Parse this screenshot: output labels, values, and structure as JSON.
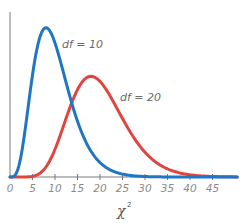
{
  "chart_data": {
    "type": "line",
    "title": "",
    "xlabel": "χ²",
    "xlabel_base": "χ",
    "xlabel_sup": "2",
    "ylabel": "",
    "xlim": [
      0,
      50
    ],
    "ylim": [
      0,
      0.105
    ],
    "grid": false,
    "x_ticks": [
      0,
      5,
      10,
      15,
      20,
      25,
      30,
      35,
      40,
      45
    ],
    "x_tick_labels": [
      "0",
      "5",
      "10",
      "15",
      "20",
      "25",
      "30",
      "35",
      "40",
      "45"
    ],
    "series": [
      {
        "name": "df = 10",
        "df": 10,
        "color": "#1f77c4",
        "label": "df = 10",
        "x": [
          0,
          2,
          4,
          6,
          8,
          10,
          12,
          14,
          16,
          18,
          20,
          25,
          30,
          35,
          40,
          45,
          50
        ],
        "values": [
          0.0,
          0.0153,
          0.0542,
          0.084,
          0.0977,
          0.0877,
          0.0743,
          0.0568,
          0.04,
          0.027,
          0.0166,
          0.0045,
          0.001,
          0.0002,
          0.0,
          0.0,
          0.0
        ]
      },
      {
        "name": "df = 20",
        "df": 20,
        "color": "#e0463f",
        "label": "df = 20",
        "x": [
          0,
          5,
          8,
          10,
          12,
          14,
          16,
          18,
          20,
          22,
          24,
          26,
          28,
          30,
          35,
          40,
          45,
          50
        ],
        "values": [
          0.0,
          0.0003,
          0.0046,
          0.0176,
          0.0353,
          0.0505,
          0.0613,
          0.0654,
          0.0626,
          0.057,
          0.0491,
          0.0404,
          0.0319,
          0.0245,
          0.0114,
          0.0045,
          0.0016,
          0.0005
        ]
      }
    ],
    "annotations": [
      {
        "text": "df = 10",
        "near_series": "df = 10"
      },
      {
        "text": "df = 20",
        "near_series": "df = 20"
      }
    ],
    "legend": "none (inline labels)"
  },
  "labels": {
    "df10": "df = 10",
    "df20": "df = 20",
    "xaxis_base": "χ",
    "xaxis_sup": "2"
  },
  "colors": {
    "blue": "#1f77c4",
    "red": "#e0463f",
    "axis": "#7a7a7a"
  }
}
